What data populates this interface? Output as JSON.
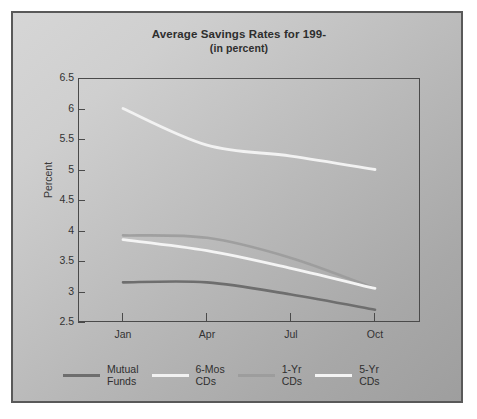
{
  "chart_data": {
    "type": "line",
    "title": "Average Savings Rates for 199-",
    "subtitle": "(in percent)",
    "xlabel": "",
    "ylabel": "Percent",
    "categories": [
      "Jan",
      "Apr",
      "Jul",
      "Oct"
    ],
    "x_tick_labels": [
      "Jan",
      "Apr",
      "Jul",
      "Oct"
    ],
    "y_tick_labels": [
      "6.5",
      "6",
      "5.5",
      "5",
      "4.5",
      "4",
      "3.5",
      "3",
      "2.5"
    ],
    "ylim": [
      2.5,
      6.5
    ],
    "y_tick_step": 0.5,
    "grid": false,
    "legend_position": "bottom",
    "series": [
      {
        "name": "Mutual Funds",
        "legend_label_line1": "Mutual",
        "legend_label_line2": "Funds",
        "color": "#6e6e6e",
        "values": [
          3.15,
          3.15,
          2.95,
          2.7
        ]
      },
      {
        "name": "6-Mos CDs",
        "legend_label_line1": "6-Mos",
        "legend_label_line2": "CDs",
        "color": "#f2f2f2",
        "values": [
          6.0,
          5.4,
          5.22,
          5.0
        ]
      },
      {
        "name": "1-Yr CDs",
        "legend_label_line1": "1-Yr",
        "legend_label_line2": "CDs",
        "color": "#9a9a9a",
        "values": [
          3.92,
          3.88,
          3.55,
          3.05
        ]
      },
      {
        "name": "5-Yr CDs",
        "legend_label_line1": "5-Yr",
        "legend_label_line2": "CDs",
        "color": "#f4f4f4",
        "values": [
          3.85,
          3.67,
          3.38,
          3.05
        ]
      }
    ]
  },
  "chart": {
    "title_line1": "Average Savings Rates for 199-",
    "title_line2": "(in percent)",
    "axis_y_label": "Percent",
    "y_ticks": [
      "6.5",
      "6",
      "5.5",
      "5",
      "4.5",
      "4",
      "3.5",
      "3",
      "2.5"
    ],
    "x_ticks": [
      "Jan",
      "Apr",
      "Jul",
      "Oct"
    ],
    "legend": [
      {
        "line1": "Mutual",
        "line2": "Funds",
        "color": "#6e6e6e"
      },
      {
        "line1": "6-Mos",
        "line2": "CDs",
        "color": "#f2f2f2"
      },
      {
        "line1": "1-Yr",
        "line2": "CDs",
        "color": "#9a9a9a"
      },
      {
        "line1": "5-Yr",
        "line2": "CDs",
        "color": "#f4f4f4"
      }
    ]
  }
}
